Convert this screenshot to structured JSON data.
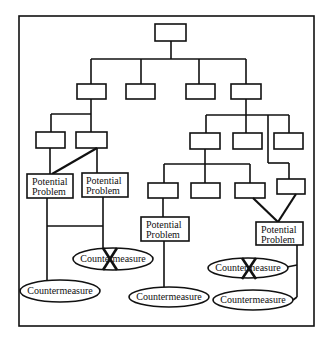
{
  "diagram": {
    "type": "fault-tree",
    "root": {
      "label": ""
    },
    "level1": [
      {
        "label": ""
      },
      {
        "label": ""
      },
      {
        "label": ""
      },
      {
        "label": ""
      }
    ],
    "potential_problems": [
      {
        "line1": "Potential",
        "line2": "Problem"
      },
      {
        "line1": "Potential",
        "line2": "Problem"
      },
      {
        "line1": "Potential",
        "line2": "Problem"
      },
      {
        "line1": "Potential",
        "line2": "Problem"
      }
    ],
    "countermeasures": [
      {
        "label": "Countermeasure",
        "rejected": false
      },
      {
        "label": "Countermeasure",
        "rejected": true
      },
      {
        "label": "Countermeasure",
        "rejected": false
      },
      {
        "label": "Countermeasure",
        "rejected": true
      },
      {
        "label": "Countermeasure",
        "rejected": false
      }
    ],
    "colors": {
      "stroke": "#111111",
      "background": "#ffffff"
    }
  }
}
